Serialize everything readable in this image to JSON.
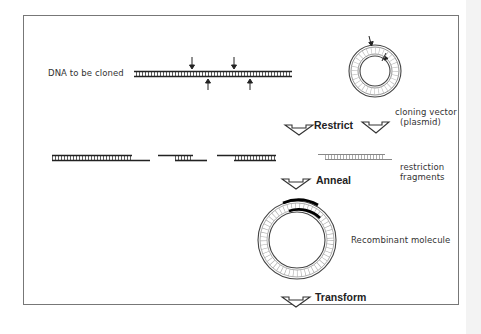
{
  "figure": {
    "labels": {
      "dna_to_clone": "DNA to be cloned",
      "vector_line1": "cloning vector",
      "vector_line2": "(plasmid)",
      "fragments_line1": "restriction",
      "fragments_line2": "fragments",
      "recombinant": "Recombinant molecule"
    },
    "steps": [
      {
        "name": "restrict",
        "label": "Restrict"
      },
      {
        "name": "anneal",
        "label": "Anneal"
      },
      {
        "name": "transform",
        "label": "Transform"
      }
    ],
    "colors": {
      "frame": "#777777",
      "strand": "#222222",
      "insert": "#000000",
      "text": "#333333",
      "right_strip": "#f3f3f3"
    }
  }
}
